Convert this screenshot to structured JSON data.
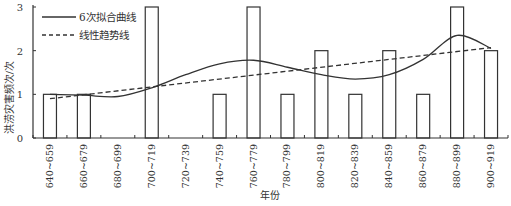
{
  "chart_data": {
    "type": "bar",
    "title": "",
    "xlabel": "年份",
    "ylabel": "洪涝灾害频次/次",
    "ylim": [
      0,
      3
    ],
    "yticks": [
      0,
      1,
      2,
      3
    ],
    "grid": false,
    "legend_position": "top-left",
    "categories": [
      "640~659",
      "660~679",
      "680~699",
      "700~719",
      "720~739",
      "740~759",
      "760~779",
      "780~799",
      "800~819",
      "820~839",
      "840~859",
      "860~879",
      "880~899",
      "900~919"
    ],
    "values": [
      1,
      1,
      0,
      3,
      0,
      1,
      3,
      1,
      2,
      1,
      2,
      1,
      3,
      2
    ],
    "series": [
      {
        "name": "洪涝灾害频次",
        "type": "bar",
        "values": [
          1,
          1,
          0,
          3,
          0,
          1,
          3,
          1,
          2,
          1,
          2,
          1,
          3,
          2
        ]
      },
      {
        "name": "6次拟合曲线",
        "type": "line",
        "style": "solid",
        "values": [
          1.0,
          0.98,
          0.95,
          1.15,
          1.45,
          1.7,
          1.78,
          1.62,
          1.45,
          1.35,
          1.45,
          1.8,
          2.35,
          2.05
        ]
      },
      {
        "name": "线性趋势线",
        "type": "line",
        "style": "dashed",
        "values": [
          0.9,
          0.99,
          1.08,
          1.17,
          1.26,
          1.35,
          1.44,
          1.53,
          1.62,
          1.71,
          1.8,
          1.89,
          1.98,
          2.07
        ]
      }
    ],
    "legend": [
      "6次拟合曲线",
      "线性趋势线"
    ]
  }
}
